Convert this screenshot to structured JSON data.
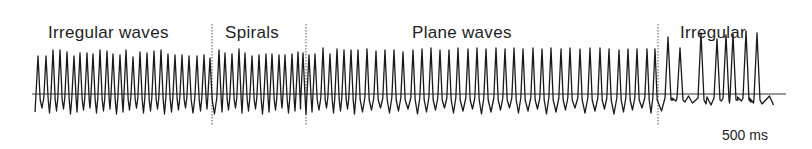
{
  "chart_data": {
    "type": "line",
    "title": "",
    "xlabel": "",
    "ylabel": "",
    "grid": false,
    "regions": [
      {
        "label": "Irregular waves",
        "x_start": 35,
        "x_end": 212
      },
      {
        "label": "Spirals",
        "x_start": 212,
        "x_end": 306
      },
      {
        "label": "Plane waves",
        "x_start": 306,
        "x_end": 658
      },
      {
        "label": "Irregular",
        "x_start": 658,
        "x_end": 785
      }
    ],
    "dividers_x": [
      212,
      306,
      658
    ],
    "scale_bar": "500 ms",
    "baseline_y": 94,
    "peaks_x": [
      38,
      46,
      53,
      60,
      67,
      74,
      80,
      87,
      93,
      100,
      107,
      113,
      120,
      126,
      133,
      140,
      147,
      154,
      161,
      168,
      175,
      182,
      189,
      197,
      204,
      210,
      219,
      225,
      232,
      239,
      245,
      252,
      259,
      266,
      272,
      279,
      285,
      292,
      298,
      303,
      309,
      315,
      323,
      330,
      337,
      344,
      351,
      358,
      367,
      376,
      385,
      394,
      403,
      413,
      422,
      431,
      440,
      449,
      458,
      468,
      477,
      486,
      496,
      505,
      514,
      523,
      533,
      542,
      551,
      561,
      570,
      580,
      590,
      600,
      609,
      619,
      628,
      637,
      647,
      655,
      668,
      680,
      701,
      717,
      726,
      733,
      746,
      757
    ],
    "peaks_h": [
      60,
      60,
      66,
      66,
      64,
      60,
      63,
      63,
      62,
      66,
      65,
      62,
      61,
      66,
      59,
      64,
      63,
      65,
      66,
      62,
      61,
      61,
      60,
      60,
      61,
      58,
      66,
      63,
      62,
      67,
      63,
      60,
      61,
      62,
      62,
      61,
      61,
      62,
      64,
      63,
      61,
      62,
      68,
      62,
      67,
      66,
      66,
      66,
      67,
      65,
      66,
      66,
      64,
      66,
      67,
      68,
      66,
      66,
      68,
      67,
      68,
      67,
      68,
      67,
      68,
      67,
      68,
      67,
      68,
      67,
      68,
      67,
      68,
      68,
      67,
      66,
      67,
      67,
      67,
      67,
      79,
      68,
      83,
      77,
      81,
      82,
      85,
      83
    ]
  },
  "labels": {
    "irregular_waves": "Irregular waves",
    "spirals": "Spirals",
    "plane_waves": "Plane waves",
    "irregular": "Irregular",
    "scale": "500 ms"
  }
}
